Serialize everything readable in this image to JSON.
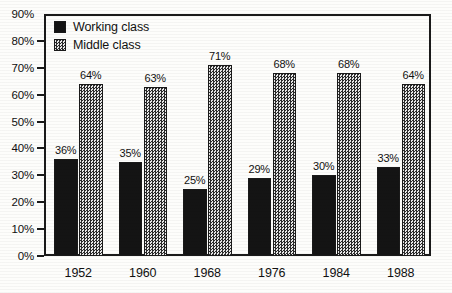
{
  "chart_data": {
    "type": "bar",
    "title": "",
    "xlabel": "",
    "ylabel": "",
    "categories": [
      "1952",
      "1960",
      "1968",
      "1976",
      "1984",
      "1988"
    ],
    "series": [
      {
        "name": "Working class",
        "values": [
          36,
          35,
          25,
          29,
          30,
          33
        ],
        "labels": [
          "36%",
          "35%",
          "25%",
          "29%",
          "30%",
          "33%"
        ],
        "color": "#141414",
        "fill": "solid-black"
      },
      {
        "name": "Middle class",
        "values": [
          64,
          63,
          71,
          68,
          68,
          64
        ],
        "labels": [
          "64%",
          "63%",
          "71%",
          "68%",
          "68%",
          "64%"
        ],
        "color": "#9a9a9a",
        "fill": "checker-dither"
      }
    ],
    "ylim": [
      0,
      90
    ],
    "ytick_values": [
      0,
      10,
      20,
      30,
      40,
      50,
      60,
      70,
      80,
      90
    ],
    "ytick_labels": [
      "0%",
      "10%",
      "20%",
      "30%",
      "40%",
      "50%",
      "60%",
      "70%",
      "80%",
      "90%"
    ],
    "grid": false,
    "legend_position": "top-left",
    "frame": true
  },
  "legend": {
    "items": [
      {
        "label": "Working class",
        "swatch": "solid-black-swatch"
      },
      {
        "label": "Middle class",
        "swatch": "checker-gray-swatch"
      }
    ]
  }
}
